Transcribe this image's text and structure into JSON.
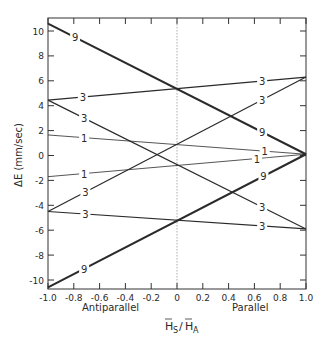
{
  "chart_data": {
    "type": "line",
    "title": "",
    "xlabel": "H_S / H_A",
    "xlabel_main": "H",
    "xlabel_sub1": "S",
    "xlabel_slash": "/",
    "xlabel_main2": "H",
    "xlabel_sub2": "A",
    "ylabel": "ΔE (mm/sec)",
    "xlim": [
      -1.0,
      1.0
    ],
    "ylim": [
      -11,
      11
    ],
    "xticks": [
      -1.0,
      -0.8,
      -0.6,
      -0.4,
      -0.2,
      0,
      0.2,
      0.4,
      0.6,
      0.8,
      1.0
    ],
    "xtick_labels": [
      "-1.0",
      "-0.8",
      "-0.6",
      "-0.4",
      "-0.2",
      "0",
      "0.2",
      "0.4",
      "0.6",
      "0.8",
      "1.0"
    ],
    "yticks": [
      10,
      8,
      6,
      4,
      2,
      0,
      -2,
      -4,
      -6,
      -8,
      -10
    ],
    "ytick_labels": [
      "10",
      "8",
      "6",
      "4",
      "2",
      "0",
      "-2",
      "-4",
      "-6",
      "-8",
      "-10"
    ],
    "region_labels": {
      "left": "Antiparallel",
      "right": "Parallel"
    },
    "reference_line": {
      "x": 0,
      "style": "dotted"
    },
    "grid": false,
    "series": [
      {
        "name": "9",
        "weight": "heavy",
        "x": [
          -1.0,
          1.0
        ],
        "y": [
          10.6,
          0.1
        ],
        "label_left_x": -0.79,
        "label_right_x": 0.66
      },
      {
        "name": "3",
        "weight": "medium",
        "x": [
          -1.0,
          1.0
        ],
        "y": [
          4.45,
          6.3
        ],
        "label_left_x": -0.73,
        "label_right_x": 0.66
      },
      {
        "name": "3",
        "weight": "medium",
        "x": [
          -1.0,
          1.0
        ],
        "y": [
          4.45,
          -5.9
        ],
        "label_left_x": -0.72,
        "label_right_x": 0.66
      },
      {
        "name": "1",
        "weight": "light",
        "x": [
          -1.0,
          1.0
        ],
        "y": [
          1.65,
          0.1
        ],
        "label_left_x": -0.72,
        "label_right_x": 0.68
      },
      {
        "name": "1",
        "weight": "light",
        "x": [
          -1.0,
          1.0
        ],
        "y": [
          -1.7,
          0.1
        ],
        "label_left_x": -0.72,
        "label_right_x": 0.62
      },
      {
        "name": "3",
        "weight": "medium",
        "x": [
          -1.0,
          1.0
        ],
        "y": [
          -4.5,
          6.3
        ],
        "label_left_x": -0.71,
        "label_right_x": 0.66
      },
      {
        "name": "3",
        "weight": "medium",
        "x": [
          -1.0,
          1.0
        ],
        "y": [
          -4.5,
          -5.9
        ],
        "label_left_x": -0.71,
        "label_right_x": 0.66
      },
      {
        "name": "9",
        "weight": "heavy",
        "x": [
          -1.0,
          1.0
        ],
        "y": [
          -10.6,
          0.1
        ],
        "label_left_x": -0.72,
        "label_right_x": 0.67
      }
    ]
  }
}
